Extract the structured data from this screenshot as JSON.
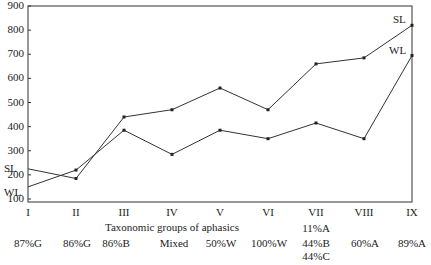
{
  "chart_data": {
    "type": "line",
    "title": "",
    "xlabel": "Taxonomic groups of aphasics",
    "ylabel": "",
    "ylim": [
      100,
      900
    ],
    "yticks": [
      100,
      200,
      300,
      400,
      500,
      600,
      700,
      800,
      900
    ],
    "categories": [
      "I",
      "II",
      "III",
      "IV",
      "V",
      "VI",
      "VII",
      "VIII",
      "IX"
    ],
    "group_composition": [
      "87%G",
      "86%G",
      "86%B",
      "Mixed",
      "50%W",
      "100%W",
      "11%A 44%B 44%C",
      "60%A",
      "89%A"
    ],
    "series": [
      {
        "name": "SL",
        "values": [
          225,
          185,
          440,
          470,
          560,
          470,
          660,
          685,
          820
        ]
      },
      {
        "name": "WL",
        "values": [
          150,
          220,
          385,
          285,
          385,
          350,
          415,
          350,
          695
        ]
      }
    ],
    "grid": false,
    "legend": "inline labels (SL, WL) at left and right ends of lines"
  },
  "labels": {
    "sl": "SL",
    "wl": "WL",
    "xlabel": "Taxonomic groups of aphasics",
    "groups": [
      "87%G",
      "86%G",
      "86%B",
      "Mixed",
      "50%W",
      "100%W",
      "11%A",
      "44%B",
      "44%C",
      "60%A",
      "89%A"
    ]
  }
}
